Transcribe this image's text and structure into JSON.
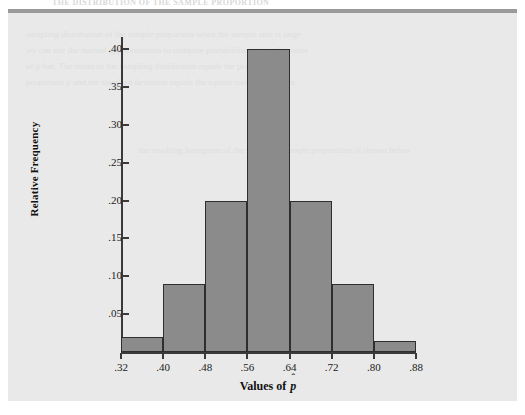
{
  "ghost_header": "THE DISTRIBUTION OF THE SAMPLE PROPORTION",
  "bleed_lines": [
    "sampling distribution of the sample proportion when the sample size is large",
    "we can use the normal approximation to compute probabilities about the value",
    "of p-hat. The mean of the sampling distribution equals the population",
    "proportion p and the standard deviation equals the square root of pq over n.",
    "the resulting histogram of the simulated sample proportions is shown below"
  ],
  "chart_data": {
    "type": "bar",
    "title": "",
    "xlabel": "Values of p̂",
    "ylabel": "Relative Frequency",
    "bin_edges": [
      0.32,
      0.4,
      0.48,
      0.56,
      0.64,
      0.72,
      0.8,
      0.88
    ],
    "categories": [
      "0.32-0.40",
      "0.40-0.48",
      "0.48-0.56",
      "0.56-0.64",
      "0.64-0.72",
      "0.72-0.80",
      "0.80-0.88"
    ],
    "values": [
      0.02,
      0.09,
      0.2,
      0.4,
      0.2,
      0.09,
      0.015
    ],
    "xlim": [
      0.32,
      0.88
    ],
    "ylim": [
      0.0,
      0.42
    ],
    "xticks": [
      0.32,
      0.4,
      0.48,
      0.56,
      0.64,
      0.72,
      0.8,
      0.88
    ],
    "xtick_labels": [
      ".32",
      ".40",
      ".48",
      ".56",
      ".64",
      ".72",
      ".80",
      ".88"
    ],
    "yticks": [
      0.05,
      0.1,
      0.15,
      0.2,
      0.25,
      0.3,
      0.35,
      0.4
    ],
    "ytick_labels": [
      ".05",
      ".10",
      ".15",
      ".20",
      ".25",
      ".30",
      ".35",
      ".40"
    ],
    "grid": false,
    "legend": "none",
    "bar_color": "#8b8b8b",
    "bar_edge_color": "#2e2e2e",
    "panel_color": "#e9e9e9",
    "axis_color": "#3a3a3a"
  }
}
